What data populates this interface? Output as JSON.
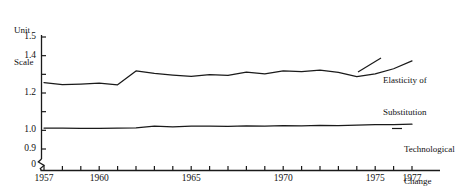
{
  "chart_data": {
    "type": "line",
    "title": "",
    "subtitle": "",
    "xlabel": "",
    "ylabel": "Unit Scale",
    "ylim": [
      0.9,
      1.5
    ],
    "xlim": [
      1957,
      1977
    ],
    "grid": false,
    "legend_position": "right-inline",
    "axis_break_y": true,
    "y_ticks": [
      0.9,
      1.0,
      1.1,
      1.2,
      1.3,
      1.4,
      1.5
    ],
    "y_tick_labels": [
      "0.9",
      "1.0",
      "",
      "1.2",
      "",
      "1.4",
      "1.5"
    ],
    "y_zero_label": "0",
    "x": [
      1957,
      1958,
      1959,
      1960,
      1961,
      1962,
      1963,
      1964,
      1965,
      1966,
      1967,
      1968,
      1969,
      1970,
      1971,
      1972,
      1973,
      1974,
      1975,
      1976,
      1977
    ],
    "x_ticks": [
      1957,
      1958,
      1959,
      1960,
      1961,
      1962,
      1963,
      1964,
      1965,
      1966,
      1967,
      1968,
      1969,
      1970,
      1971,
      1972,
      1973,
      1974,
      1975,
      1976,
      1977
    ],
    "x_tick_labels": [
      "1957",
      "",
      "",
      "1960",
      "",
      "",
      "",
      "",
      "1965",
      "",
      "",
      "",
      "",
      "1970",
      "",
      "",
      "",
      "",
      "1975",
      "",
      "1977"
    ],
    "series": [
      {
        "name": "Elasticity of Substitution",
        "values": [
          1.256,
          1.245,
          1.248,
          1.253,
          1.244,
          1.318,
          1.305,
          1.296,
          1.289,
          1.299,
          1.294,
          1.312,
          1.303,
          1.318,
          1.314,
          1.322,
          1.31,
          1.288,
          1.302,
          1.33,
          1.372
        ]
      },
      {
        "name": "Technological Change",
        "values": [
          1.012,
          1.012,
          1.011,
          1.011,
          1.012,
          1.013,
          1.022,
          1.018,
          1.022,
          1.023,
          1.021,
          1.024,
          1.022,
          1.025,
          1.024,
          1.026,
          1.025,
          1.028,
          1.03,
          1.031,
          1.033
        ]
      }
    ]
  },
  "axis": {
    "unit_scale_line1": "Unit",
    "unit_scale_line2": "Scale"
  },
  "labels": {
    "elasticity_line1": "Elasticity of",
    "elasticity_line2": "Substitution",
    "technological_line1": "Technological",
    "technological_line2": "Change"
  },
  "colors": {
    "line": "#1a1a1a",
    "axis": "#1a1a1a",
    "background": "#ffffff",
    "text": "#111111"
  }
}
